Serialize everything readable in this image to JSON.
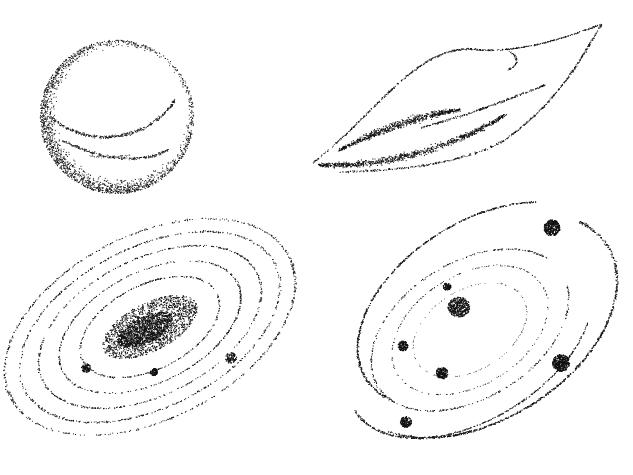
{
  "canvas": {
    "width": 633,
    "height": 475,
    "background": "#ffffff",
    "ink": "#111111"
  },
  "illustrations": [
    {
      "id": "planet",
      "label": "stippled sphere planet",
      "box": [
        30,
        30,
        180,
        170
      ]
    },
    {
      "id": "comet",
      "label": "stippled leaf-shaped comet/nebula",
      "box": [
        300,
        15,
        310,
        170
      ]
    },
    {
      "id": "spiral-galaxy",
      "label": "stippled elliptical spiral galaxy with bright core",
      "box": [
        20,
        220,
        280,
        230
      ]
    },
    {
      "id": "solar-system",
      "label": "stippled solar system with orbiting planets",
      "box": [
        330,
        205,
        280,
        250
      ]
    }
  ]
}
